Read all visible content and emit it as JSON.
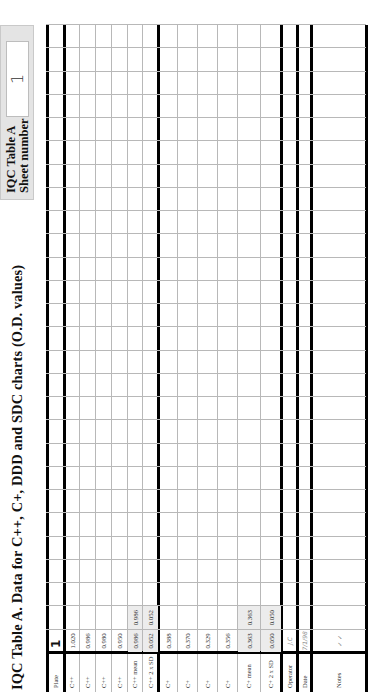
{
  "title": "IQC Table A. Data for C++, C+,  DDD and SDC charts (O.D. values)",
  "sheet": {
    "label_line1": "IQC Table A",
    "label_line2": "Sheet number",
    "number": "1"
  },
  "table": {
    "row_labels": {
      "plate": "Plate",
      "cpp1": "C++",
      "cpp2": "C++",
      "cpp3": "C++",
      "cpp4": "C++",
      "cpp_mean": "C++ mean",
      "cpp_2sd": "C++ 2 x SD",
      "cp1": "C+",
      "cp2": "C+",
      "cp3": "C+",
      "cp4": "C+",
      "cp_mean": "C+ mean",
      "cp_2sd": "C+ 2 x SD",
      "operator": "Operator",
      "date": "Date",
      "notes": "Notes"
    },
    "column_count": 27,
    "columns": [
      {
        "plate": "1",
        "cpp1": "1.020",
        "cpp2": "0.986",
        "cpp3": "0.980",
        "cpp4": "0.950",
        "cpp_mean": "0.986",
        "cpp_2sd": "0.052",
        "cp1": "0.388",
        "cp2": "0.370",
        "cp3": "0.329",
        "cp4": "0.356",
        "cp_mean": "0.363",
        "cp_2sd": "0.050",
        "operator": "J.C",
        "date": "7/1/98",
        "notes": "✓ ✓"
      },
      {
        "cpp_mean": "0.986",
        "cpp_2sd": "0.052",
        "cp_mean": "0.363",
        "cp_2sd": "0.050"
      }
    ]
  }
}
